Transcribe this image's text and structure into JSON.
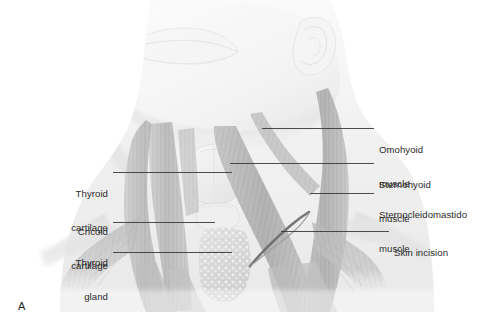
{
  "figure": {
    "panel_label": "A",
    "background_color": "#ffffff",
    "ink_color": "#2b2b2b",
    "leader_color": "#3a3a3a"
  },
  "labels_left": [
    {
      "name": "thyroid-cartilage",
      "line1": "Thyroid",
      "line2": "cartilage",
      "text_right": 108,
      "text_top": 165,
      "leader": {
        "x1": 113,
        "y1": 172,
        "x2": 232,
        "y2": 172
      }
    },
    {
      "name": "cricoid-cartilage",
      "line1": "Cricoid",
      "line2": "cartilage",
      "text_right": 108,
      "text_top": 203,
      "leader": {
        "x1": 113,
        "y1": 222,
        "x2": 215,
        "y2": 222
      }
    },
    {
      "name": "thyroid-gland",
      "line1": "Thyroid",
      "line2": "gland",
      "text_right": 108,
      "text_top": 234,
      "leader": {
        "x1": 113,
        "y1": 252,
        "x2": 232,
        "y2": 252
      }
    }
  ],
  "labels_right": [
    {
      "name": "omohyoid-muscle",
      "line1": "Omohyoid",
      "line2": "muscle",
      "text_left": 379,
      "text_top": 121,
      "leader": {
        "x1": 262,
        "y1": 128,
        "x2": 374,
        "y2": 128
      }
    },
    {
      "name": "sternohyoid-muscle",
      "line1": "Sternohyoid",
      "line2": "muscle",
      "text_left": 379,
      "text_top": 156,
      "leader": {
        "x1": 230,
        "y1": 163,
        "x2": 374,
        "y2": 163
      }
    },
    {
      "name": "sternocleidomastoid-muscle",
      "line1": "Sternocleidomastido",
      "line2": "muscle",
      "text_left": 379,
      "text_top": 186,
      "leader": {
        "x1": 310,
        "y1": 193,
        "x2": 374,
        "y2": 193
      }
    },
    {
      "name": "skin-incision",
      "line1": "Skin incision",
      "line2": "",
      "text_left": 394,
      "text_top": 224,
      "leader": {
        "x1": 281,
        "y1": 231,
        "x2": 389,
        "y2": 231
      }
    }
  ],
  "illustration": {
    "subject": "anterior neck dissection, grayscale medical illustration",
    "structures": [
      "chin and lower lip outline",
      "right ear and mandible angle",
      "neck skin contour",
      "sternocleidomastoid muscle (left and right)",
      "sternohyoid muscle strap bands",
      "omohyoid muscle",
      "thyroid cartilage",
      "cricoid cartilage",
      "thyroid gland lobes and isthmus",
      "tracheal rings",
      "clavicles and shoulder slope",
      "curved skin incision arc"
    ],
    "palette": {
      "skin_light": "#f2f2f2",
      "skin_mid": "#e2e2e2",
      "muscle_light": "#cfcfcf",
      "muscle_mid": "#b0b0b0",
      "muscle_dark": "#9a9a9a",
      "cartilage": "#ededed",
      "gland": "#d6d6d6",
      "incision": "#6f6f6f",
      "outline": "#cccccc"
    }
  }
}
